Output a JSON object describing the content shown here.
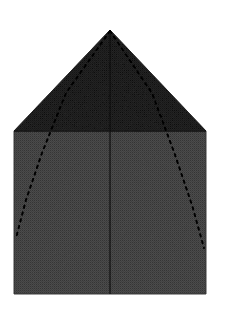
{
  "figure": {
    "title": "Origami fold step diagram",
    "background_color": "#ffffff",
    "canvas": {
      "width": 225,
      "height": 315
    }
  },
  "colors": {
    "paper_front": "#808080",
    "paper_back": "#565656",
    "crease_solid": "#3a3a3a",
    "crease_dashed": "#1c1c1c",
    "outline": "#6d6d6d",
    "background": "#ffffff",
    "halftone_dot": "#5c5c5c"
  },
  "shapes": {
    "square_body": {
      "label": "paper-body",
      "fill": "#808080",
      "left": 14,
      "top": 131,
      "right": 206,
      "bottom": 294,
      "points": "14,131 206,131 206,294 14,294"
    },
    "triangle_flap": {
      "label": "folded-flap",
      "fill": "#565656",
      "apex_x": 110,
      "apex_y": 30,
      "base_left_x": 14,
      "base_left_y": 131,
      "base_right_x": 206,
      "base_right_y": 131,
      "points": "110,30 206,131 14,131"
    }
  },
  "creases": {
    "center_vertical": {
      "label": "center-crease",
      "style": "solid",
      "color": "#3a3a3a",
      "width": 1.1,
      "x1": 110,
      "y1": 30,
      "x2": 110,
      "y2": 294
    },
    "left_dashed": {
      "label": "left-fold-line",
      "style": "dashed",
      "color": "#1c1c1c",
      "width": 1.8,
      "dash": "2.5 4.5",
      "path": "M 110 31 L 66 93 L 42 153 L 26 200 L 16 238"
    },
    "right_dashed": {
      "label": "right-fold-line",
      "style": "dashed",
      "color": "#1c1c1c",
      "width": 1.8,
      "dash": "2.5 4.5",
      "path": "M 110 31 L 152 93 L 174 152 L 192 205 L 204 248"
    }
  },
  "texture": {
    "type": "halftone-dot-screen",
    "dot_spacing": 2,
    "dot_radius": 0.48,
    "note": "scanned print halftone grain over both gray regions"
  }
}
